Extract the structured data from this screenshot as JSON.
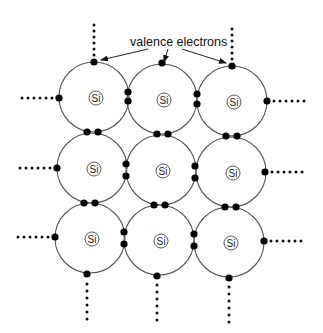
{
  "annotation": {
    "label": "valence electrons",
    "x": 130,
    "y": 46,
    "arrows": [
      {
        "from": [
          148,
          49
        ],
        "to": [
          101,
          60
        ]
      },
      {
        "from": [
          168,
          49
        ],
        "to": [
          164,
          62
        ]
      },
      {
        "from": [
          182,
          49
        ],
        "to": [
          226,
          63
        ]
      }
    ]
  },
  "atom_label": "Si",
  "atom_radius": 35,
  "nucleus_radius": 7,
  "electron_radius": 3.6,
  "atoms": [
    {
      "id": "r1c1",
      "cx": 94,
      "cy": 97,
      "label": "Si"
    },
    {
      "id": "r1c2",
      "cx": 162,
      "cy": 99,
      "label": "Si"
    },
    {
      "id": "r1c3",
      "cx": 232,
      "cy": 101,
      "label": "Si"
    },
    {
      "id": "r2c1",
      "cx": 92,
      "cy": 168,
      "label": "Si"
    },
    {
      "id": "r2c2",
      "cx": 161,
      "cy": 170,
      "label": "Si"
    },
    {
      "id": "r2c3",
      "cx": 231,
      "cy": 172,
      "label": "Si"
    },
    {
      "id": "r3c1",
      "cx": 90,
      "cy": 238,
      "label": "Si"
    },
    {
      "id": "r3c2",
      "cx": 159,
      "cy": 240,
      "label": "Si"
    },
    {
      "id": "r3c3",
      "cx": 229,
      "cy": 242,
      "label": "Si"
    }
  ],
  "electrons": [
    [
      94,
      62
    ],
    [
      162,
      63
    ],
    [
      232,
      66
    ],
    [
      59,
      98
    ],
    [
      267,
      101
    ],
    [
      128,
      92
    ],
    [
      128,
      101
    ],
    [
      197,
      94
    ],
    [
      197,
      104
    ],
    [
      87,
      132
    ],
    [
      98,
      132
    ],
    [
      157,
      134
    ],
    [
      168,
      134
    ],
    [
      226,
      136
    ],
    [
      237,
      136
    ],
    [
      57,
      168
    ],
    [
      265,
      172
    ],
    [
      126,
      164
    ],
    [
      126,
      176
    ],
    [
      195,
      166
    ],
    [
      195,
      178
    ],
    [
      84,
      203
    ],
    [
      95,
      203
    ],
    [
      154,
      205
    ],
    [
      165,
      205
    ],
    [
      225,
      207
    ],
    [
      236,
      207
    ],
    [
      55,
      237
    ],
    [
      264,
      241
    ],
    [
      124,
      232
    ],
    [
      124,
      244
    ],
    [
      194,
      234
    ],
    [
      194,
      246
    ],
    [
      87,
      274
    ],
    [
      157,
      276
    ],
    [
      229,
      278
    ]
  ],
  "bond_lines": [
    {
      "direction": "up",
      "x": 94,
      "y_start": 55,
      "count": 6,
      "step": 6
    },
    {
      "direction": "up",
      "x": 232,
      "y_start": 59,
      "count": 6,
      "step": 6
    },
    {
      "direction": "left",
      "y": 98,
      "x_start": 52,
      "count": 6,
      "step": 6
    },
    {
      "direction": "left",
      "y": 168,
      "x_start": 50,
      "count": 6,
      "step": 6
    },
    {
      "direction": "left",
      "y": 237,
      "x_start": 48,
      "count": 6,
      "step": 6
    },
    {
      "direction": "right",
      "y": 101,
      "x_start": 274,
      "count": 6,
      "step": 6
    },
    {
      "direction": "right",
      "y": 172,
      "x_start": 272,
      "count": 6,
      "step": 6
    },
    {
      "direction": "right",
      "y": 241,
      "x_start": 271,
      "count": 6,
      "step": 6
    },
    {
      "direction": "down",
      "x": 87,
      "y_start": 284,
      "count": 6,
      "step": 7
    },
    {
      "direction": "down",
      "x": 157,
      "y_start": 285,
      "count": 6,
      "step": 7
    },
    {
      "direction": "down",
      "x": 229,
      "y_start": 287,
      "count": 6,
      "step": 7
    }
  ],
  "colors": {
    "shell": "#555555",
    "electron": "#000000",
    "background": "#ffffff"
  }
}
